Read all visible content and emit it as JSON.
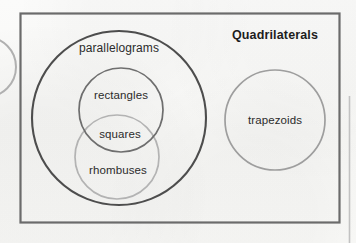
{
  "figure": {
    "title": "Quadrilaterals",
    "kind": "venn-diagram",
    "frame": {
      "stroke_color": "#6b6b6b"
    },
    "sets": [
      {
        "id": "parallelograms",
        "label": "parallelograms",
        "shape": "circle",
        "stroke_color": "#4d4d4d",
        "stroke_width": 2.1,
        "cx": 119,
        "cy": 118,
        "r": 87,
        "label_x": 119,
        "label_y": 48
      },
      {
        "id": "rectangles",
        "label": "rectangles",
        "shape": "circle",
        "stroke_color": "#6e6e6e",
        "stroke_width": 1.7,
        "cx": 121,
        "cy": 110,
        "r": 42,
        "label_x": 121,
        "label_y": 95
      },
      {
        "id": "rhombuses",
        "label": "rhombuses",
        "shape": "circle",
        "stroke_color": "#b3b3b3",
        "stroke_width": 1.7,
        "cx": 117,
        "cy": 157,
        "r": 42,
        "label_x": 118,
        "label_y": 170
      },
      {
        "id": "squares",
        "label": "squares",
        "shape": "intersection",
        "of": [
          "rectangles",
          "rhombuses"
        ],
        "label_x": 120,
        "label_y": 134
      },
      {
        "id": "trapezoids",
        "label": "trapezoids",
        "shape": "circle",
        "stroke_color": "#9e9e9e",
        "stroke_width": 1.7,
        "cx": 275,
        "cy": 120,
        "r": 50,
        "label_x": 275,
        "label_y": 120
      }
    ],
    "title_x": 275,
    "title_y": 35,
    "edge_artifacts": [
      {
        "id": "left-partial-circle",
        "note": "arc cut off at left page edge"
      },
      {
        "id": "right-page-edge-line",
        "note": "vertical rule near right edge"
      }
    ]
  }
}
